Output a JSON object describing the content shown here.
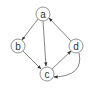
{
  "diagram": {
    "type": "directed-graph",
    "colors": {
      "stroke": "#555555",
      "fill": "#ffffff",
      "text": "#333333"
    },
    "nodes": [
      {
        "id": "a",
        "label": "a",
        "x": 43,
        "y": 14
      },
      {
        "id": "b",
        "label": "b",
        "x": 18,
        "y": 46
      },
      {
        "id": "c",
        "label": "c",
        "x": 47,
        "y": 74
      },
      {
        "id": "d",
        "label": "d",
        "x": 76,
        "y": 46
      }
    ],
    "edges": [
      {
        "from": "a",
        "to": "b"
      },
      {
        "from": "a",
        "to": "c"
      },
      {
        "from": "b",
        "to": "c"
      },
      {
        "from": "c",
        "to": "d"
      },
      {
        "from": "d",
        "to": "a"
      },
      {
        "from": "d",
        "to": "c",
        "curved": true
      }
    ]
  }
}
